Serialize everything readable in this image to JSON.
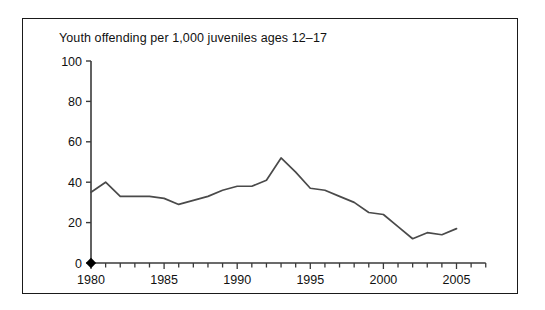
{
  "figure": {
    "title": "Youth offending per 1,000 juveniles ages 12–17",
    "border_color": "#1a1a1a",
    "background": "#ffffff"
  },
  "chart_data": {
    "type": "line",
    "title": "Youth offending per 1,000 juveniles ages 12–17",
    "xlabel": "",
    "ylabel": "",
    "xlim": [
      1980,
      2007
    ],
    "ylim": [
      0,
      100
    ],
    "grid": false,
    "legend": false,
    "line_color": "#4a4a4a",
    "marker": {
      "name": "origin-diamond-marker",
      "shape": "diamond",
      "color": "#000000",
      "x": 1980,
      "y": 0
    },
    "y_ticks": [
      0,
      20,
      40,
      60,
      80,
      100
    ],
    "y_tick_labels": [
      "0",
      "20",
      "40",
      "60",
      "80",
      "100"
    ],
    "x_ticks": [
      1980,
      1985,
      1990,
      1995,
      2000,
      2005
    ],
    "x_tick_labels": [
      "1980",
      "1985",
      "1990",
      "1995",
      "2000",
      "2005"
    ],
    "x_minor_tick_interval": 1,
    "x": [
      1980,
      1981,
      1982,
      1983,
      1984,
      1985,
      1986,
      1987,
      1988,
      1989,
      1990,
      1991,
      1992,
      1993,
      1994,
      1995,
      1996,
      1997,
      1998,
      1999,
      2000,
      2001,
      2002,
      2003,
      2004,
      2005
    ],
    "values": [
      35,
      40,
      33,
      33,
      33,
      32,
      29,
      31,
      33,
      36,
      38,
      38,
      41,
      52,
      45,
      37,
      36,
      33,
      30,
      25,
      24,
      18,
      12,
      15,
      14,
      17
    ],
    "series": [
      {
        "name": "Youth offending rate",
        "values": [
          35,
          40,
          33,
          33,
          33,
          32,
          29,
          31,
          33,
          36,
          38,
          38,
          41,
          52,
          45,
          37,
          36,
          33,
          30,
          25,
          24,
          18,
          12,
          15,
          14,
          17
        ]
      }
    ]
  }
}
